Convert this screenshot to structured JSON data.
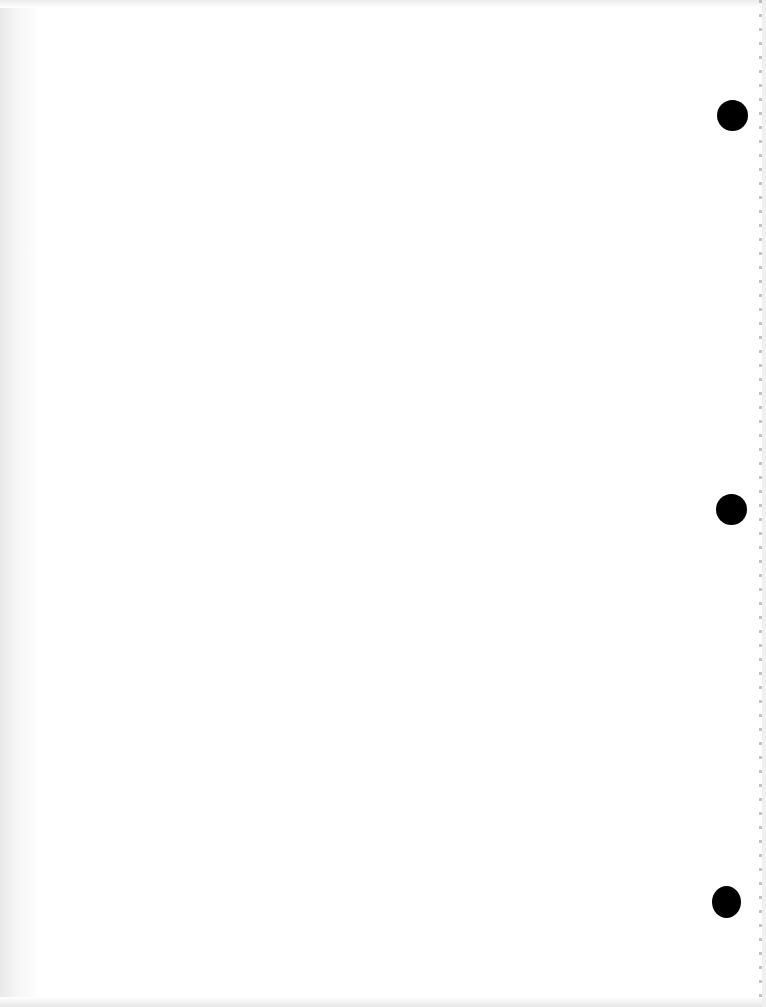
{
  "document": {
    "type": "scanned blank page",
    "text": "",
    "background_color": "#ffffff",
    "punch_holes": [
      {
        "cx": 732,
        "cy": 115,
        "w": 31,
        "h": 31,
        "color": "#000000"
      },
      {
        "cx": 731,
        "cy": 509,
        "w": 31,
        "h": 31,
        "color": "#000000"
      },
      {
        "cx": 726,
        "cy": 902,
        "w": 29,
        "h": 32,
        "color": "#000000"
      }
    ]
  }
}
